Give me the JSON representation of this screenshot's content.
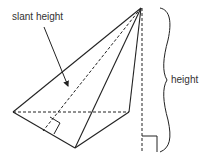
{
  "diagram": {
    "labels": {
      "slant_height": "slant height",
      "height": "height"
    },
    "colors": {
      "stroke": "#222222",
      "text": "#333333",
      "background": "#ffffff"
    }
  }
}
